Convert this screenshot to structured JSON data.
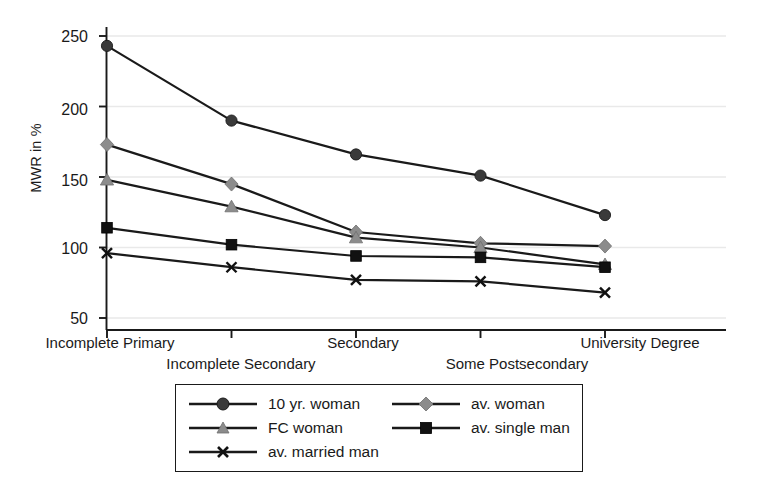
{
  "chart_data": {
    "type": "line",
    "title": "",
    "xlabel": "",
    "ylabel": "MWR in %",
    "categories": [
      "Incomplete Primary",
      "Incomplete Secondary",
      "Secondary",
      "Some Postsecondary",
      "University Degree"
    ],
    "yticks": [
      50,
      100,
      150,
      200,
      250
    ],
    "ylim": [
      35,
      262
    ],
    "grid": "horizontal-light",
    "legend_position": "below-axes",
    "series": [
      {
        "name": "10 yr. woman",
        "marker": "circle",
        "color": "#3a3a3a",
        "line_color": "#1a1a1a",
        "values": [
          243,
          190,
          166,
          151,
          123
        ]
      },
      {
        "name": "av. woman",
        "marker": "diamond",
        "color": "#8c8c8c",
        "line_color": "#1a1a1a",
        "values": [
          173,
          145,
          111,
          103,
          101
        ]
      },
      {
        "name": "FC woman",
        "marker": "triangle",
        "color": "#8c8c8c",
        "line_color": "#1a1a1a",
        "values": [
          148,
          129,
          107,
          100,
          88
        ]
      },
      {
        "name": "av. single man",
        "marker": "square",
        "color": "#111111",
        "line_color": "#1a1a1a",
        "values": [
          114,
          102,
          94,
          93,
          86
        ]
      },
      {
        "name": "av. married man",
        "marker": "x",
        "color": "#111111",
        "line_color": "#1a1a1a",
        "values": [
          96,
          86,
          77,
          76,
          68
        ]
      }
    ]
  },
  "axes": {
    "y_title": "MWR in %",
    "y_tick_labels": [
      "250",
      "200",
      "150",
      "100",
      "50"
    ],
    "x_tick_labels_row1": [
      "Incomplete Primary",
      "Secondary",
      "University Degree"
    ],
    "x_tick_labels_row2": [
      "Incomplete Secondary",
      "Some Postsecondary"
    ]
  },
  "legend": {
    "entries": [
      {
        "label": "10 yr. woman",
        "marker": "circle-marker"
      },
      {
        "label": "FC woman",
        "marker": "triangle-marker"
      },
      {
        "label": "av. married man",
        "marker": "x-marker"
      },
      {
        "label": "av. woman",
        "marker": "diamond-marker"
      },
      {
        "label": "av. single man",
        "marker": "square-marker"
      }
    ]
  },
  "colors": {
    "axis": "#1a1a1a",
    "grid": "#e9e9e9",
    "dark_marker": "#3a3a3a",
    "gray_marker": "#8c8c8c",
    "black_marker": "#111111",
    "background": "#ffffff"
  }
}
